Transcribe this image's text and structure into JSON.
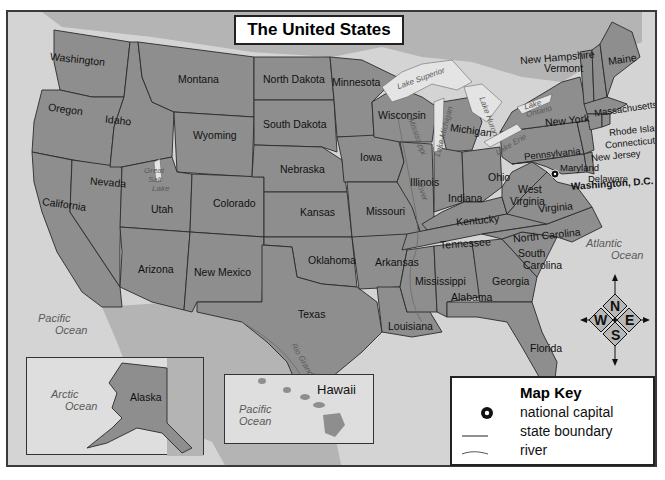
{
  "title": "The United States",
  "colors": {
    "land_state": "#8e8e8e",
    "foreign_land": "#b4b4b4",
    "water": "#d4d4d4",
    "lakes": "#e4e4e4",
    "border": "#2a2a2a"
  },
  "states": {
    "washington": "Washington",
    "oregon": "Oregon",
    "california": "California",
    "idaho": "Idaho",
    "nevada": "Nevada",
    "montana": "Montana",
    "wyoming": "Wyoming",
    "utah": "Utah",
    "arizona": "Arizona",
    "colorado": "Colorado",
    "new_mexico": "New Mexico",
    "north_dakota": "North Dakota",
    "south_dakota": "South Dakota",
    "nebraska": "Nebraska",
    "kansas": "Kansas",
    "oklahoma": "Oklahoma",
    "texas": "Texas",
    "minnesota": "Minnesota",
    "iowa": "Iowa",
    "missouri": "Missouri",
    "arkansas": "Arkansas",
    "louisiana": "Louisiana",
    "wisconsin": "Wisconsin",
    "illinois": "Illinois",
    "michigan": "Michigan",
    "indiana": "Indiana",
    "ohio": "Ohio",
    "kentucky": "Kentucky",
    "tennessee": "Tennessee",
    "mississippi": "Mississippi",
    "alabama": "Alabama",
    "georgia": "Georgia",
    "florida": "Florida",
    "south_carolina_1": "South",
    "south_carolina_2": "Carolina",
    "north_carolina": "North Carolina",
    "virginia": "Virginia",
    "west_virginia_1": "West",
    "west_virginia_2": "Virginia",
    "pennsylvania": "Pennsylvania",
    "new_york": "New York",
    "maryland": "Maryland",
    "delaware": "Delaware",
    "new_jersey": "New Jersey",
    "connecticut": "Connecticut",
    "rhode_island": "Rhode Island",
    "massachusetts": "Massachusetts",
    "vermont": "Vermont",
    "new_hampshire": "New Hampshire",
    "maine": "Maine",
    "alaska": "Alaska",
    "hawaii": "Hawaii"
  },
  "capital": "Washington, D.C.",
  "water_labels": {
    "pacific_main_1": "Pacific",
    "pacific_main_2": "Ocean",
    "atlantic_1": "Atlantic",
    "atlantic_2": "Ocean",
    "arctic_1": "Arctic",
    "arctic_2": "Ocean",
    "pacific_hawaii_1": "Pacific",
    "pacific_hawaii_2": "Ocean",
    "lake_superior": "Lake Superior",
    "lake_michigan": "Lake Michigan",
    "lake_huron": "Lake Huron",
    "lake_erie": "Lake Erie",
    "lake_ontario_1": "Lake",
    "lake_ontario_2": "Ontario",
    "great_salt_lake_1": "Great",
    "great_salt_lake_2": "Salt",
    "great_salt_lake_3": "Lake",
    "mississippi_river": "Mississippi",
    "river_suffix": "River",
    "rio_grande": "Rio Grande"
  },
  "compass": {
    "n": "N",
    "e": "E",
    "s": "S",
    "w": "W"
  },
  "map_key": {
    "title": "Map Key",
    "items": [
      {
        "symbol": "national-capital-icon",
        "label": "national capital"
      },
      {
        "symbol": "state-boundary-line",
        "label": "state boundary"
      },
      {
        "symbol": "river-line",
        "label": "river"
      }
    ]
  }
}
